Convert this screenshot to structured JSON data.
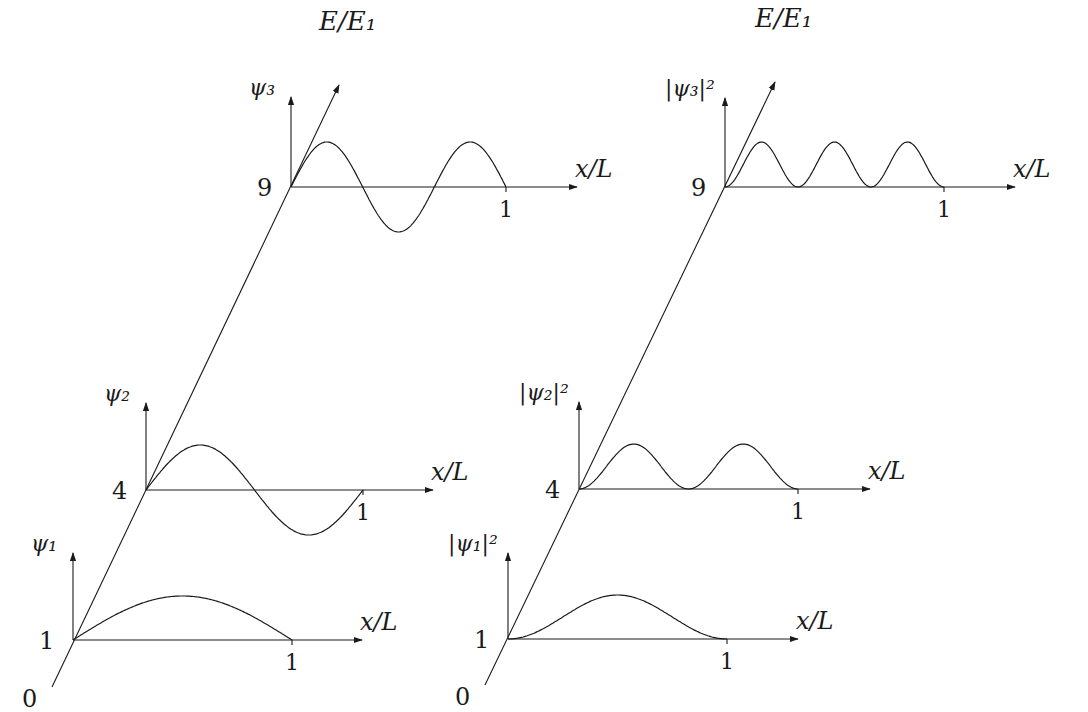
{
  "figure": {
    "panels": [
      {
        "id": "wavefunctions",
        "energy_axis_label": "E/E₁",
        "energy_axis": {
          "start": [
            52,
            687
          ],
          "tip": [
            339,
            85
          ]
        },
        "levels": [
          {
            "n": 1,
            "energy_label": "1",
            "func_label": "ψ₁",
            "origin": [
              73,
              640
            ],
            "end_x": 292,
            "arrow_x": 362,
            "axis_top": 553,
            "amplitude": 44,
            "squared": false,
            "tick_label": "1",
            "x_label": "x/L"
          },
          {
            "n": 2,
            "energy_label": "4",
            "func_label": "ψ₂",
            "origin": [
              146,
              490
            ],
            "end_x": 363,
            "arrow_x": 433,
            "axis_top": 403,
            "amplitude": 45,
            "squared": false,
            "tick_label": "1",
            "x_label": "x/L"
          },
          {
            "n": 3,
            "energy_label": "9",
            "func_label": "ψ₃",
            "origin": [
              291,
              187
            ],
            "end_x": 506,
            "arrow_x": 577,
            "axis_top": 97,
            "amplitude": 45,
            "squared": false,
            "tick_label": "1",
            "x_label": "x/L"
          }
        ],
        "zero_label": "0"
      },
      {
        "id": "probability-densities",
        "energy_axis_label": "E/E₁",
        "energy_axis": {
          "start": [
            485,
            685
          ],
          "tip": [
            775,
            82
          ]
        },
        "levels": [
          {
            "n": 1,
            "energy_label": "1",
            "func_label": "|ψ₁|²",
            "origin": [
              508,
              639
            ],
            "end_x": 727,
            "arrow_x": 798,
            "axis_top": 553,
            "amplitude": 44,
            "squared": true,
            "tick_label": "1",
            "x_label": "x/L"
          },
          {
            "n": 2,
            "energy_label": "4",
            "func_label": "|ψ₂|²",
            "origin": [
              579,
              489
            ],
            "end_x": 798,
            "arrow_x": 870,
            "axis_top": 402,
            "amplitude": 45,
            "squared": true,
            "tick_label": "1",
            "x_label": "x/L"
          },
          {
            "n": 3,
            "energy_label": "9",
            "func_label": "|ψ₃|²",
            "origin": [
              725,
              187
            ],
            "end_x": 944,
            "arrow_x": 1015,
            "axis_top": 98,
            "amplitude": 45,
            "squared": true,
            "tick_label": "1",
            "x_label": "x/L"
          }
        ],
        "zero_label": "0"
      }
    ],
    "line_color": "#1a1a1a"
  },
  "chart_data": {
    "type": "line",
    "xlabel": "x/L",
    "ylabel": "E/E₁",
    "energy_levels": [
      1,
      4,
      9
    ],
    "x_range": [
      0,
      1
    ],
    "series": [
      {
        "name": "ψ1",
        "energy": 1,
        "formula": "sin(πx/L)",
        "nodes_interior": 0
      },
      {
        "name": "ψ2",
        "energy": 4,
        "formula": "sin(2πx/L)",
        "nodes_interior": 1
      },
      {
        "name": "ψ3",
        "energy": 9,
        "formula": "sin(3πx/L)",
        "nodes_interior": 2
      },
      {
        "name": "|ψ1|²",
        "energy": 1,
        "formula": "sin²(πx/L)",
        "peaks": 1
      },
      {
        "name": "|ψ2|²",
        "energy": 4,
        "formula": "sin²(2πx/L)",
        "peaks": 2
      },
      {
        "name": "|ψ3|²",
        "energy": 9,
        "formula": "sin²(3πx/L)",
        "peaks": 3
      }
    ]
  }
}
